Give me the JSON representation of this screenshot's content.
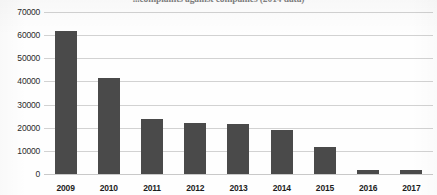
{
  "chart_data": {
    "type": "bar",
    "title": "...complaints against companies (2014 data)",
    "title_note": "title is cropped off the top edge of the screenshot",
    "xlabel": "",
    "ylabel": "",
    "categories": [
      "2009",
      "2010",
      "2011",
      "2012",
      "2013",
      "2014",
      "2015",
      "2016",
      "2017"
    ],
    "values": [
      61700,
      41500,
      23600,
      22000,
      21400,
      19000,
      11700,
      1800,
      1700
    ],
    "ylim": [
      0,
      70000
    ],
    "y_ticks": [
      0,
      10000,
      20000,
      30000,
      40000,
      50000,
      60000,
      70000
    ],
    "y_tick_labels": [
      "0",
      "10000",
      "20000",
      "30000",
      "40000",
      "50000",
      "60000",
      "70000"
    ],
    "grid": true,
    "grid_axis": "y",
    "legend": false,
    "legend_position": "none",
    "bar_color": "#4a4a4a",
    "gridline_color": "#d2d2d2",
    "background_color": "#fefefe"
  }
}
